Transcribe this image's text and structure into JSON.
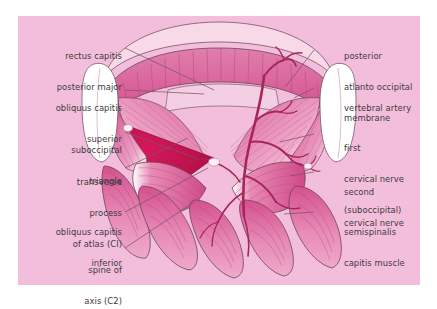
{
  "figure": {
    "kind": "anatomical-illustration",
    "region": "suboccipital triangle, posterior neck (dissection view)",
    "panel_background": "#f3bedb",
    "label_text_color": "#3d3a3c",
    "leader_line_color": "#7a5466",
    "palette": {
      "panel_pink": "#f3bedb",
      "muscle_mid_pink": "#e07fae",
      "muscle_deep_pink": "#d4508d",
      "triangle_dark_red": "#c7134f",
      "tendon_white": "#ffffff",
      "membrane_pale": "#f7d9e8",
      "vessel_red": "#a8255a",
      "outline": "#6e4457"
    }
  },
  "labels_left": [
    {
      "id": "rectus-capitis-posterior-major",
      "lines": [
        "rectus capitis",
        "posterior major"
      ]
    },
    {
      "id": "obliquus-capitis-superior",
      "lines": [
        "obliquus capitis",
        "superior"
      ]
    },
    {
      "id": "suboccipital-triangle",
      "lines": [
        "suboccipital",
        "triangle"
      ]
    },
    {
      "id": "transverse-process-of-atlas",
      "lines": [
        "transverse",
        "process",
        "of atlas (CI)"
      ]
    },
    {
      "id": "obliquus-capitis-inferior",
      "lines": [
        "obliquus capitis",
        "inferior"
      ]
    },
    {
      "id": "spine-of-axis",
      "lines": [
        "spine of",
        "axis (C2)"
      ]
    }
  ],
  "labels_right": [
    {
      "id": "posterior-atlanto-occipital-membrane",
      "lines": [
        "posterior",
        "atlanto occipital",
        "membrane"
      ]
    },
    {
      "id": "vertebral-artery",
      "lines": [
        "vertebral artery"
      ]
    },
    {
      "id": "first-cervical-nerve",
      "lines": [
        "first",
        "cervical nerve",
        "(suboccipital)"
      ]
    },
    {
      "id": "second-cervical-nerve",
      "lines": [
        "second",
        "cervical nerve"
      ]
    },
    {
      "id": "semispinalis-capitis-muscle",
      "lines": [
        "semispinalis",
        "capitis muscle"
      ]
    }
  ]
}
